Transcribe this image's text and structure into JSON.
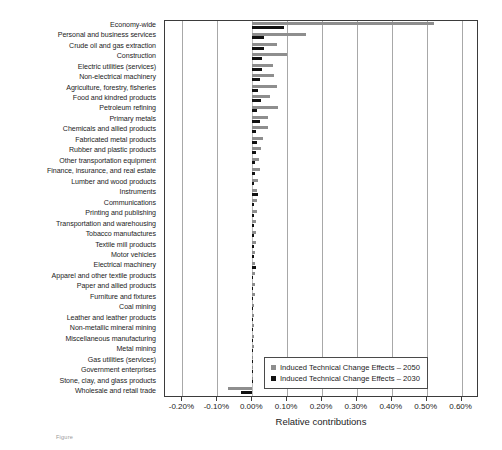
{
  "chart_data": {
    "type": "bar",
    "orientation": "horizontal",
    "title": "",
    "xlabel": "Relative contributions",
    "ylabel": "",
    "xlim": [
      -0.0025,
      0.0065
    ],
    "xticks": [
      "-0.20%",
      "-0.10%",
      "0.00%",
      "0.10%",
      "0.20%",
      "0.30%",
      "0.40%",
      "0.50%",
      "0.60%"
    ],
    "xtick_values": [
      -0.2,
      -0.1,
      0.0,
      0.1,
      0.2,
      0.3,
      0.4,
      0.5,
      0.6
    ],
    "grid": true,
    "grid_axis": "x",
    "legend_position": "lower right",
    "units": "percent",
    "categories": [
      "Economy-wide",
      "Personal and business services",
      "Crude oil and gas extraction",
      "Construction",
      "Electric utilities (services)",
      "Non-electrical machinery",
      "Agriculture, forestry, fisheries",
      "Food and kindred products",
      "Petroleum refining",
      "Primary metals",
      "Chemicals and allied products",
      "Fabricated metal products",
      "Rubber and plastic products",
      "Other transportation equipment",
      "Finance, insurance, and real estate",
      "Lumber and wood products",
      "Instruments",
      "Communications",
      "Printing and publishing",
      "Transportation and warehousing",
      "Tobacco manufactures",
      "Textile mill products",
      "Motor vehicles",
      "Electrical machinery",
      "Apparel and other textile products",
      "Paper and allied products",
      "Furniture and fixtures",
      "Coal mining",
      "Leather and leather products",
      "Non-metallic mineral mining",
      "Miscellaneous manufacturing",
      "Metal mining",
      "Gas utilities (services)",
      "Government enterprises",
      "Stone, clay, and glass products",
      "Wholesale and retail trade"
    ],
    "series": [
      {
        "name": "Induced Technical Change Effects – 2050",
        "color": "#8e8e8e",
        "values": [
          0.521,
          0.155,
          0.072,
          0.1,
          0.06,
          0.061,
          0.072,
          0.05,
          0.074,
          0.045,
          0.044,
          0.03,
          0.026,
          0.02,
          0.021,
          0.018,
          0.015,
          0.014,
          0.013,
          0.012,
          0.01,
          0.01,
          0.009,
          0.009,
          0.008,
          0.007,
          0.007,
          0.006,
          0.005,
          0.005,
          0.004,
          0.004,
          0.003,
          0.003,
          0.002,
          -0.07
        ]
      },
      {
        "name": "Induced Technical Change Effects – 2030",
        "color": "#111111",
        "values": [
          0.092,
          0.034,
          0.034,
          0.029,
          0.028,
          0.023,
          0.017,
          0.026,
          0.013,
          0.021,
          0.012,
          0.014,
          0.01,
          0.009,
          0.008,
          0.006,
          0.018,
          0.006,
          0.005,
          0.005,
          0.004,
          0.004,
          0.004,
          0.011,
          0.003,
          0.003,
          0.003,
          0.002,
          0.002,
          0.002,
          0.002,
          0.001,
          0.001,
          0.001,
          0.001,
          -0.031
        ]
      }
    ]
  },
  "legend": {
    "entries": [
      {
        "label": "Induced Technical Change Effects – 2050",
        "color": "#8e8e8e"
      },
      {
        "label": "Induced Technical Change Effects – 2030",
        "color": "#111111"
      }
    ]
  },
  "caption": {
    "text": "Figure"
  }
}
